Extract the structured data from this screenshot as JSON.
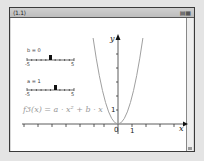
{
  "window": {
    "tab_label": "⟨1.1⟩",
    "tab_icons": "▤▦"
  },
  "sliders": [
    {
      "label": "b = 0",
      "min_label": "-5",
      "max_label": "5",
      "min": -5,
      "max": 5,
      "value": 0
    },
    {
      "label": "a = 1",
      "min_label": "-5",
      "max_label": "5",
      "min": -5,
      "max": 5,
      "value": 1
    }
  ],
  "function_label": "f3(x) = a · x² + b · x",
  "graph": {
    "x_axis_label": "x",
    "y_axis_label": "y",
    "origin_label": "0",
    "x_tick_label": "1",
    "y_tick_label": "1",
    "curve_color": "#a0a0a0"
  }
}
